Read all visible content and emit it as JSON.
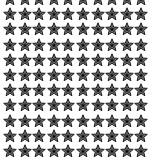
{
  "pattern": {
    "columns": 10,
    "rows": 11,
    "visible_full_rows": 10,
    "partial_top_row": true,
    "icon": "star-icon",
    "colors": {
      "outline": "#1a1a1a",
      "fill": "#7a7a7a",
      "inner": "#3a3a3a",
      "center": "#000000",
      "background": "#ffffff"
    }
  }
}
